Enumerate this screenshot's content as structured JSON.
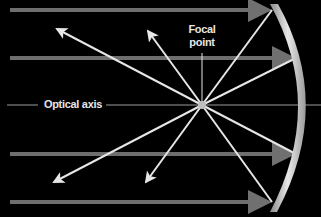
{
  "diagram": {
    "type": "concave-mirror-ray-diagram",
    "labels": {
      "focal_point_line1": "Focal",
      "focal_point_line2": "point",
      "optical_axis": "Optical axis"
    },
    "colors": {
      "background": "#000000",
      "incoming_rays": "#6e6e6e",
      "reflected_rays": "#e6e6e6",
      "mirror": "#cfcfcf",
      "axis": "#9a9a9a"
    },
    "focal_point": {
      "x": 202,
      "y": 105
    },
    "incoming_rays_y": [
      10,
      58,
      154,
      202
    ],
    "reflected_ray_count": 4
  }
}
